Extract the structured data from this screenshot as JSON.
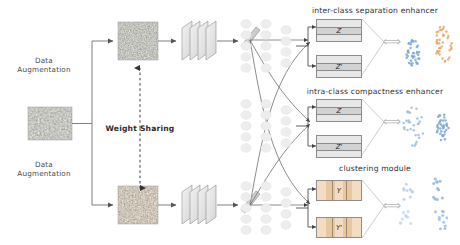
{
  "figure": {
    "background": "#ffffff"
  },
  "pipeline": {
    "augmentation_top_label": "Data\nAugmentation",
    "augmentation_bottom_label": "Data\nAugmentation",
    "weight_sharing_label": "Weight Sharing"
  },
  "branches": [
    {
      "name": "top-branch",
      "image_name": "augmented-image-top",
      "encoder_name": "cnn-encoder-top",
      "feature_name": "feature-vector-top"
    },
    {
      "name": "source",
      "image_name": "input-image",
      "encoder_name": null,
      "feature_name": null
    },
    {
      "name": "bottom-branch",
      "image_name": "augmented-image-bottom",
      "encoder_name": "cnn-encoder-bottom",
      "feature_name": "feature-vector-bottom"
    }
  ],
  "modules": [
    {
      "id": "inter-class",
      "title": "inter-class separation enhancer",
      "head_name": "mlp-head-inter-class",
      "top_box_label": "Z",
      "bottom_box_label": "Z'",
      "box_style": "horizontal-stripe",
      "equiv_symbol": "⟺",
      "scatter": {
        "type": "scatter",
        "description": "two well separated clusters",
        "clusters": [
          {
            "name": "cluster-a",
            "color": "#7aa6d6",
            "n": 38,
            "cx": 0.27,
            "cy": 0.58,
            "rx": 0.13,
            "ry": 0.24
          },
          {
            "name": "cluster-b",
            "color": "#e8a868",
            "n": 40,
            "cx": 0.76,
            "cy": 0.42,
            "rx": 0.15,
            "ry": 0.3
          }
        ]
      }
    },
    {
      "id": "intra-class",
      "title": "intra-class compactness enhancer",
      "head_name": "mlp-head-intra-class",
      "top_box_label": "Z",
      "bottom_box_label": "Z'",
      "box_style": "horizontal-stripe",
      "equiv_symbol": "⟺",
      "scatter": {
        "type": "scatter",
        "description": "diffuse cloud versus compact cloud",
        "clusters": [
          {
            "name": "cluster-diffuse",
            "color": "#9cbde0",
            "n": 30,
            "cx": 0.26,
            "cy": 0.5,
            "rx": 0.17,
            "ry": 0.34
          },
          {
            "name": "cluster-compact",
            "color": "#7aa6d6",
            "n": 34,
            "cx": 0.74,
            "cy": 0.48,
            "rx": 0.11,
            "ry": 0.26
          }
        ]
      }
    },
    {
      "id": "clustering",
      "title": "clustering module",
      "head_name": "mlp-head-clustering",
      "top_box_label": "Y",
      "bottom_box_label": "Y'",
      "box_style": "vertical-stripe",
      "equiv_symbol": "⟺",
      "scatter": {
        "type": "scatter",
        "description": "four sparse assignment clusters",
        "clusters": [
          {
            "name": "cluster-1",
            "color": "#bcd0e8",
            "n": 9,
            "cx": 0.24,
            "cy": 0.3,
            "rx": 0.1,
            "ry": 0.16
          },
          {
            "name": "cluster-2",
            "color": "#8fb4dd",
            "n": 11,
            "cx": 0.7,
            "cy": 0.26,
            "rx": 0.11,
            "ry": 0.17
          },
          {
            "name": "cluster-3",
            "color": "#c7d8ec",
            "n": 9,
            "cx": 0.22,
            "cy": 0.74,
            "rx": 0.11,
            "ry": 0.15
          },
          {
            "name": "cluster-4",
            "color": "#9dbfe3",
            "n": 11,
            "cx": 0.72,
            "cy": 0.74,
            "rx": 0.12,
            "ry": 0.17
          }
        ]
      }
    }
  ],
  "colors": {
    "line": "#6f6f6f",
    "text": "#333333",
    "stripe_gray_light": "#e7e7e7",
    "stripe_gray_dark": "#d2d2d2",
    "stripe_tan_light": "#f3dcc2",
    "stripe_tan_dark": "#e8c79e",
    "node_fill": "#ededed",
    "conv_fill": "#e2e2e2",
    "feature_bar": "#c9c9c9"
  }
}
